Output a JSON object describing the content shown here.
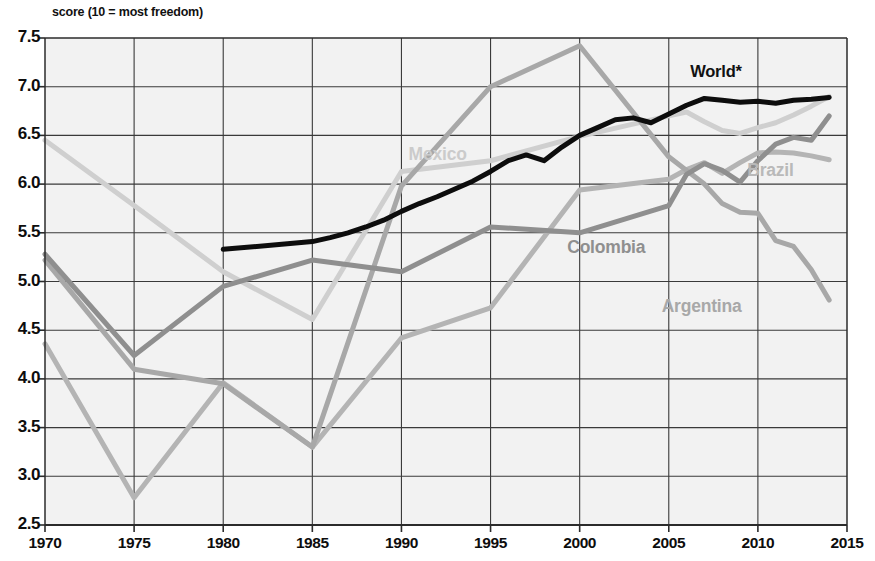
{
  "chart_data": {
    "type": "line",
    "title": "score (10 = most freedom)",
    "xlabel": "",
    "ylabel": "",
    "xlim": [
      1970,
      2015
    ],
    "ylim": [
      2.5,
      7.5
    ],
    "grid": true,
    "legend_position": "inline-labels",
    "x_ticks": [
      "1970",
      "1975",
      "1980",
      "1985",
      "1990",
      "1995",
      "2000",
      "2005",
      "2010",
      "2015"
    ],
    "y_ticks": [
      "2.5",
      "3.0",
      "3.5",
      "4.0",
      "4.5",
      "5.0",
      "5.5",
      "6.0",
      "6.5",
      "7.0",
      "7.5"
    ],
    "annotations": [
      {
        "text": "World*",
        "x": 2006.2,
        "y": 7.13,
        "color": "#111111",
        "size": 16.5
      },
      {
        "text": "Mexico",
        "x": 1990.4,
        "y": 6.28,
        "color": "#cbcbcb",
        "size": 17.5
      },
      {
        "text": "Brazil",
        "x": 2009.4,
        "y": 6.12,
        "color": "#b9b9b9",
        "size": 17.5
      },
      {
        "text": "Colombia",
        "x": 1999.3,
        "y": 5.33,
        "color": "#8f8f8f",
        "size": 17.5
      },
      {
        "text": "Argentina",
        "x": 2004.6,
        "y": 4.72,
        "color": "#a8a8a8",
        "size": 17.5
      }
    ],
    "series": [
      {
        "name": "World*",
        "color": "#0d0d0d",
        "width": 5.0,
        "x": [
          1980,
          1985,
          1986,
          1987,
          1988,
          1989,
          1990,
          1991,
          1992,
          1993,
          1994,
          1995,
          1996,
          1997,
          1998,
          1999,
          2000,
          2001,
          2002,
          2003,
          2004,
          2005,
          2006,
          2007,
          2008,
          2009,
          2010,
          2011,
          2012,
          2013,
          2014
        ],
        "values": [
          5.33,
          5.41,
          5.45,
          5.5,
          5.56,
          5.63,
          5.72,
          5.8,
          5.87,
          5.95,
          6.03,
          6.13,
          6.24,
          6.3,
          6.24,
          6.38,
          6.5,
          6.58,
          6.66,
          6.68,
          6.63,
          6.72,
          6.81,
          6.88,
          6.86,
          6.84,
          6.85,
          6.83,
          6.86,
          6.87,
          6.89
        ]
      },
      {
        "name": "Mexico",
        "color": "#cfcfcf",
        "width": 5.0,
        "x": [
          1970,
          1975,
          1980,
          1985,
          1990,
          1995,
          2000,
          2005,
          2006,
          2007,
          2008,
          2009,
          2010,
          2011,
          2012,
          2013,
          2014
        ],
        "values": [
          6.45,
          5.78,
          5.1,
          4.61,
          6.13,
          6.24,
          6.49,
          6.7,
          6.74,
          6.64,
          6.55,
          6.52,
          6.58,
          6.63,
          6.71,
          6.8,
          6.9
        ]
      },
      {
        "name": "Colombia",
        "color": "#8f8f8f",
        "width": 5.0,
        "x": [
          1970,
          1975,
          1980,
          1985,
          1990,
          1995,
          2000,
          2005,
          2006,
          2007,
          2008,
          2009,
          2010,
          2011,
          2012,
          2013,
          2014
        ],
        "values": [
          5.28,
          4.24,
          4.95,
          5.22,
          5.1,
          5.56,
          5.5,
          5.78,
          6.1,
          6.21,
          6.14,
          6.02,
          6.24,
          6.41,
          6.48,
          6.45,
          6.7
        ]
      },
      {
        "name": "Argentina",
        "color": "#a8a8a8",
        "width": 5.0,
        "x": [
          1970,
          1975,
          1980,
          1985,
          1990,
          1995,
          2000,
          2005,
          2006,
          2007,
          2008,
          2009,
          2010,
          2011,
          2012,
          2013,
          2014
        ],
        "values": [
          5.22,
          4.1,
          3.95,
          3.3,
          5.98,
          7.0,
          7.42,
          6.28,
          6.14,
          6.0,
          5.8,
          5.71,
          5.7,
          5.42,
          5.36,
          5.12,
          4.81
        ]
      },
      {
        "name": "Brazil",
        "color": "#b4b4b4",
        "width": 5.0,
        "x": [
          1970,
          1975,
          1980,
          1985,
          1990,
          1995,
          2000,
          2005,
          2006,
          2007,
          2008,
          2009,
          2010,
          2011,
          2012,
          2013,
          2014
        ],
        "values": [
          4.36,
          2.78,
          3.96,
          3.3,
          4.42,
          4.73,
          5.94,
          6.05,
          6.15,
          6.22,
          6.11,
          6.22,
          6.32,
          6.33,
          6.32,
          6.29,
          6.25
        ]
      }
    ],
    "axis_color": "#2b2b2b",
    "grid_color": "#3a3a3a",
    "plot_bg": "#f2f2f2"
  }
}
